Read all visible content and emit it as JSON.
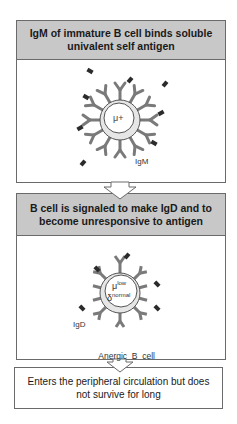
{
  "diagram": {
    "step1": {
      "title": "IgM of immature B cell binds soluble univalent self antigen",
      "cell_marker": "μ+",
      "receptor_label": "IgM"
    },
    "step2": {
      "title": "B cell is signaled to make IgD and to become unresponsive to antigen",
      "cell_marker_mu": "μ",
      "cell_marker_mu_sup": "low",
      "cell_marker_delta": "δ",
      "cell_marker_delta_sup": "normal",
      "receptor_label": "IgD",
      "cell_label": "Anergic  B  cell"
    },
    "step3": {
      "text": "Enters the peripheral circulation but does not survive for long"
    },
    "colors": {
      "header_fill": "#c8c8c8",
      "border": "#6a6a6a",
      "receptor": "#7a7a7a",
      "antigen": "#2b2b2b",
      "cell_ring": "#e6e6e6"
    }
  }
}
